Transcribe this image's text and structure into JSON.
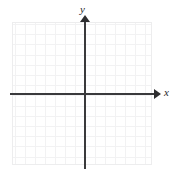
{
  "figure": {
    "kind": "coordinate-plane",
    "title": "",
    "background_color": "#ffffff"
  },
  "axes": {
    "x": {
      "label": "x",
      "arrow": "right",
      "color": "#3a3a3c"
    },
    "y": {
      "label": "y",
      "arrow": "up",
      "color": "#3a3a3c"
    }
  },
  "grid": {
    "visible": true,
    "major_color": "#e2e2e4",
    "minor_color": "#f2f2f3",
    "border_color": "#ededee",
    "columns_major": 7,
    "rows_major": 7,
    "minor_per_major": 2
  },
  "chart_data": {
    "type": "scatter",
    "title": "",
    "xlabel": "x",
    "ylabel": "y",
    "xlim": [
      -7,
      7
    ],
    "ylim": [
      -7,
      7
    ],
    "grid": true,
    "legend": "none",
    "x": [],
    "y": [],
    "series": [],
    "annotations": [],
    "xticklabels": [],
    "yticklabels": []
  }
}
